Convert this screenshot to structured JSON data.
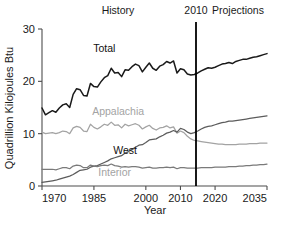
{
  "chart_data": {
    "type": "line",
    "title": "",
    "xlabel": "Year",
    "ylabel": "Quadrillion Kilojoules Btu",
    "xlim": [
      1970,
      2035
    ],
    "ylim": [
      0,
      30
    ],
    "xticks": [
      1970,
      1985,
      2000,
      2010,
      2020,
      2035
    ],
    "xticklabels": [
      "1970",
      "1985",
      "2000",
      "2010",
      "2020",
      "2035"
    ],
    "yticks": [
      0,
      10,
      20,
      30
    ],
    "yticklabels": [
      "0",
      "10",
      "20",
      "30"
    ],
    "grid": false,
    "legend": "inline-series-labels",
    "annotations": [
      {
        "name": "history-label",
        "text": "History",
        "x": 1988,
        "position": "top"
      },
      {
        "name": "divider-year-label",
        "text": "2010",
        "x": 2010,
        "position": "top"
      },
      {
        "name": "projections-label",
        "text": "Projections",
        "x": 2023,
        "position": "top"
      },
      {
        "name": "divider-line",
        "text": "",
        "x": 2010,
        "position": "vertical-rule"
      }
    ],
    "x": [
      1970,
      1971,
      1972,
      1973,
      1974,
      1975,
      1976,
      1977,
      1978,
      1979,
      1980,
      1981,
      1982,
      1983,
      1984,
      1985,
      1986,
      1987,
      1988,
      1989,
      1990,
      1991,
      1992,
      1993,
      1994,
      1995,
      1996,
      1997,
      1998,
      1999,
      2000,
      2001,
      2002,
      2003,
      2004,
      2005,
      2006,
      2007,
      2008,
      2009,
      2010,
      2011,
      2012,
      2013,
      2014,
      2015,
      2016,
      2017,
      2018,
      2019,
      2020,
      2021,
      2022,
      2023,
      2024,
      2025,
      2026,
      2027,
      2028,
      2029,
      2030,
      2031,
      2032,
      2033,
      2034,
      2035
    ],
    "series": [
      {
        "name": "Total",
        "color": "#1a1a1a",
        "label_x": 1988,
        "label_y": 25.6,
        "values": [
          14.9,
          13.6,
          14.0,
          14.4,
          14.1,
          14.9,
          15.5,
          15.7,
          15.0,
          17.5,
          18.6,
          18.4,
          17.3,
          17.2,
          19.6,
          19.0,
          18.9,
          19.9,
          20.7,
          21.1,
          22.5,
          21.6,
          21.7,
          20.9,
          22.2,
          22.1,
          22.8,
          23.3,
          23.0,
          21.8,
          22.7,
          23.5,
          22.5,
          22.1,
          22.9,
          23.2,
          23.8,
          23.5,
          23.9,
          21.6,
          22.4,
          22.2,
          21.4,
          21.2,
          21.3,
          21.6,
          22.0,
          22.3,
          22.6,
          22.5,
          22.7,
          23.0,
          23.3,
          23.4,
          23.6,
          23.4,
          23.8,
          24.0,
          24.2,
          24.2,
          24.4,
          24.6,
          24.7,
          24.9,
          25.1,
          25.3
        ]
      },
      {
        "name": "Appalachia",
        "color": "#a3a3a3",
        "label_x": 1992,
        "label_y": 13.6,
        "values": [
          10.3,
          10.0,
          10.1,
          10.2,
          10.0,
          10.2,
          10.5,
          10.4,
          10.0,
          11.1,
          11.4,
          11.2,
          10.5,
          10.4,
          11.8,
          11.2,
          10.9,
          11.3,
          11.8,
          11.6,
          12.2,
          11.6,
          11.7,
          11.1,
          11.8,
          11.5,
          11.7,
          11.9,
          11.6,
          10.9,
          11.3,
          11.6,
          11.0,
          10.7,
          11.1,
          11.2,
          11.5,
          11.1,
          11.3,
          10.1,
          10.5,
          10.2,
          9.5,
          9.0,
          8.7,
          8.6,
          8.5,
          8.4,
          8.3,
          8.2,
          8.1,
          8.0,
          8.0,
          7.9,
          7.9,
          7.9,
          7.9,
          8.0,
          8.0,
          8.0,
          8.1,
          8.1,
          8.1,
          8.2,
          8.2,
          8.2
        ]
      },
      {
        "name": "West",
        "color": "#5c5c5c",
        "label_x": 1994,
        "label_y": 6.1,
        "values": [
          0.7,
          0.8,
          0.9,
          1.0,
          1.1,
          1.3,
          1.5,
          1.7,
          1.9,
          2.2,
          2.6,
          3.0,
          3.1,
          3.2,
          3.6,
          3.8,
          3.9,
          4.2,
          4.5,
          4.8,
          5.2,
          5.4,
          5.6,
          5.8,
          6.3,
          6.6,
          7.0,
          7.4,
          7.8,
          7.9,
          8.3,
          8.8,
          8.9,
          9.0,
          9.4,
          9.7,
          10.1,
          10.3,
          10.6,
          10.3,
          11.0,
          10.8,
          10.3,
          10.0,
          10.2,
          10.5,
          10.9,
          11.2,
          11.4,
          11.5,
          11.7,
          11.9,
          12.1,
          12.2,
          12.4,
          12.4,
          12.5,
          12.6,
          12.7,
          12.8,
          12.9,
          13.0,
          13.1,
          13.2,
          13.3,
          13.4
        ]
      },
      {
        "name": "Interior",
        "color": "#7a7a7a",
        "label_x": 1991,
        "label_y": 1.9,
        "values": [
          3.2,
          3.2,
          3.2,
          3.2,
          3.1,
          3.3,
          3.5,
          3.5,
          3.3,
          3.8,
          4.0,
          3.9,
          3.5,
          3.5,
          4.0,
          3.8,
          3.7,
          3.9,
          4.0,
          3.9,
          4.2,
          3.9,
          3.8,
          3.6,
          3.7,
          3.6,
          3.7,
          3.7,
          3.6,
          3.4,
          3.5,
          3.6,
          3.4,
          3.4,
          3.5,
          3.5,
          3.6,
          3.5,
          3.6,
          3.3,
          3.5,
          3.5,
          3.4,
          3.4,
          3.4,
          3.4,
          3.5,
          3.5,
          3.5,
          3.5,
          3.6,
          3.6,
          3.6,
          3.6,
          3.7,
          3.7,
          3.7,
          3.8,
          3.8,
          3.9,
          3.9,
          4.0,
          4.0,
          4.1,
          4.1,
          4.2
        ]
      }
    ]
  }
}
